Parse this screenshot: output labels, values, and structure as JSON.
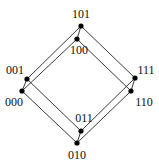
{
  "colors": {
    "edge": "#222222",
    "node": "#000000",
    "label": "#111111",
    "background": "#ffffff"
  },
  "nodes": [
    {
      "id": "101",
      "label": "101"
    },
    {
      "id": "100",
      "label": "100"
    },
    {
      "id": "001",
      "label": "001"
    },
    {
      "id": "000",
      "label": "000"
    },
    {
      "id": "111",
      "label": "111"
    },
    {
      "id": "110",
      "label": "110"
    },
    {
      "id": "011",
      "label": "011"
    },
    {
      "id": "010",
      "label": "010"
    }
  ],
  "edges": [
    [
      "101",
      "001"
    ],
    [
      "100",
      "000"
    ],
    [
      "101",
      "111"
    ],
    [
      "100",
      "110"
    ],
    [
      "001",
      "011"
    ],
    [
      "000",
      "010"
    ],
    [
      "111",
      "011"
    ],
    [
      "110",
      "010"
    ],
    [
      "101",
      "100"
    ],
    [
      "001",
      "000"
    ],
    [
      "111",
      "110"
    ],
    [
      "011",
      "010"
    ]
  ]
}
